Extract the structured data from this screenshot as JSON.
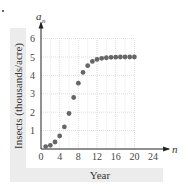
{
  "chart_data": {
    "type": "scatter",
    "title": "",
    "xlabel": "Year",
    "ylabel": "Insects (thousands/acre)",
    "x_axis_symbol": "n",
    "y_axis_symbol": "a_n",
    "xlim": [
      0,
      24
    ],
    "ylim": [
      0,
      6
    ],
    "x_ticks": [
      0,
      4,
      8,
      12,
      16,
      20,
      24
    ],
    "y_ticks": [
      1,
      2,
      3,
      4,
      5,
      6
    ],
    "grid": true,
    "legend": null,
    "series": [
      {
        "name": "a_n",
        "color": "#666666",
        "x": [
          1,
          2,
          3,
          4,
          5,
          6,
          7,
          8,
          9,
          10,
          11,
          12,
          13,
          14,
          15,
          16,
          17,
          18,
          19,
          20
        ],
        "values": [
          0.13,
          0.2,
          0.38,
          0.71,
          1.2,
          1.93,
          2.8,
          3.58,
          4.16,
          4.53,
          4.76,
          4.87,
          4.93,
          4.96,
          4.98,
          4.99,
          5.0,
          5.0,
          5.0,
          5.0
        ]
      }
    ]
  },
  "labels": {
    "xlabel": "Year",
    "ylabel": "Insects (thousands/acre)",
    "x_symbol": "n",
    "y_symbol": "a",
    "y_symbol_sub": "n"
  }
}
